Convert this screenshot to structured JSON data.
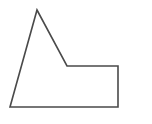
{
  "figure": {
    "type": "polygon-outline",
    "shape": "pentagon",
    "stroke_color": "#4a4a4a",
    "fill_color": "none",
    "stroke_width": 1.6,
    "points": "10,107 37,10 67,66 118,66 118,107"
  }
}
